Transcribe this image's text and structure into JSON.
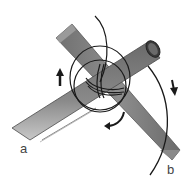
{
  "diagram": {
    "labels": {
      "a": "a",
      "b": "b"
    },
    "arrows": [
      {
        "name": "arrow-up-left",
        "direction": "up"
      },
      {
        "name": "arrow-down-right",
        "direction": "down"
      },
      {
        "name": "arrow-curved-bottom",
        "direction": "down-left"
      }
    ],
    "colors": {
      "background": "#ffffff",
      "pole_dark": "#5a5a5a",
      "pole_mid": "#7d7d7d",
      "pole_light": "#b5b5b5",
      "rope": "#1a1a1a",
      "label": "#444444"
    }
  }
}
